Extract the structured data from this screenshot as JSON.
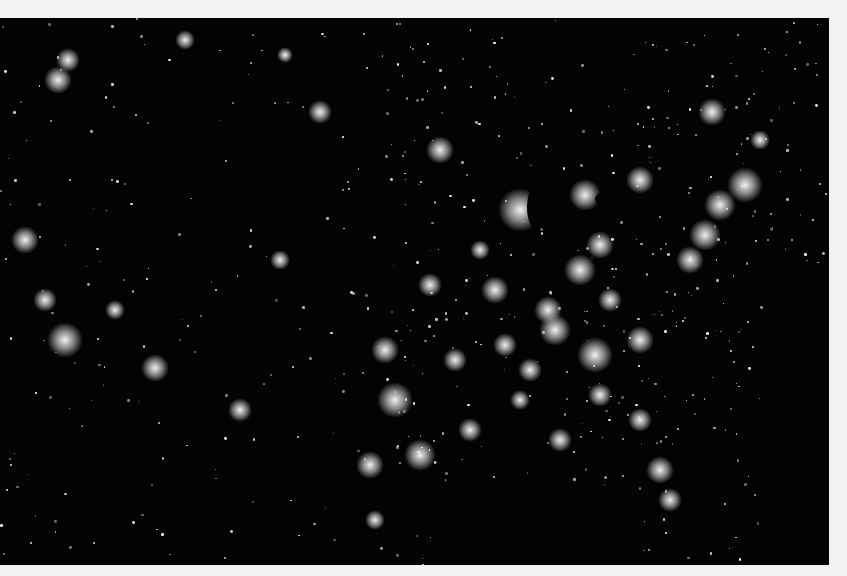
{
  "image": {
    "subject": "United States at night - city lights satellite view",
    "frame_color": "#f2f2f2",
    "background_color": "#030303",
    "light_color": "#ffffff"
  },
  "cities": [
    {
      "x": 440,
      "y": 150,
      "r": 14
    },
    {
      "x": 520,
      "y": 210,
      "r": 22
    },
    {
      "x": 585,
      "y": 195,
      "r": 16
    },
    {
      "x": 640,
      "y": 180,
      "r": 14
    },
    {
      "x": 712,
      "y": 112,
      "r": 14
    },
    {
      "x": 745,
      "y": 185,
      "r": 18
    },
    {
      "x": 720,
      "y": 205,
      "r": 16
    },
    {
      "x": 705,
      "y": 235,
      "r": 16
    },
    {
      "x": 690,
      "y": 260,
      "r": 14
    },
    {
      "x": 600,
      "y": 245,
      "r": 14
    },
    {
      "x": 580,
      "y": 270,
      "r": 16
    },
    {
      "x": 548,
      "y": 310,
      "r": 14
    },
    {
      "x": 555,
      "y": 330,
      "r": 16
    },
    {
      "x": 595,
      "y": 355,
      "r": 18
    },
    {
      "x": 640,
      "y": 340,
      "r": 14
    },
    {
      "x": 530,
      "y": 370,
      "r": 12
    },
    {
      "x": 495,
      "y": 290,
      "r": 14
    },
    {
      "x": 430,
      "y": 285,
      "r": 12
    },
    {
      "x": 385,
      "y": 350,
      "r": 14
    },
    {
      "x": 395,
      "y": 400,
      "r": 18
    },
    {
      "x": 420,
      "y": 455,
      "r": 16
    },
    {
      "x": 370,
      "y": 465,
      "r": 14
    },
    {
      "x": 455,
      "y": 360,
      "r": 12
    },
    {
      "x": 505,
      "y": 345,
      "r": 12
    },
    {
      "x": 470,
      "y": 430,
      "r": 12
    },
    {
      "x": 560,
      "y": 440,
      "r": 12
    },
    {
      "x": 640,
      "y": 420,
      "r": 12
    },
    {
      "x": 660,
      "y": 470,
      "r": 14
    },
    {
      "x": 670,
      "y": 500,
      "r": 12
    },
    {
      "x": 155,
      "y": 368,
      "r": 14
    },
    {
      "x": 115,
      "y": 310,
      "r": 10
    },
    {
      "x": 65,
      "y": 340,
      "r": 18
    },
    {
      "x": 45,
      "y": 300,
      "r": 12
    },
    {
      "x": 25,
      "y": 240,
      "r": 14
    },
    {
      "x": 58,
      "y": 80,
      "r": 14
    },
    {
      "x": 68,
      "y": 60,
      "r": 12
    },
    {
      "x": 185,
      "y": 40,
      "r": 10
    },
    {
      "x": 240,
      "y": 410,
      "r": 12
    },
    {
      "x": 280,
      "y": 260,
      "r": 10
    },
    {
      "x": 320,
      "y": 112,
      "r": 12
    },
    {
      "x": 285,
      "y": 55,
      "r": 8
    },
    {
      "x": 375,
      "y": 520,
      "r": 10
    },
    {
      "x": 760,
      "y": 140,
      "r": 10
    },
    {
      "x": 480,
      "y": 250,
      "r": 10
    },
    {
      "x": 610,
      "y": 300,
      "r": 12
    },
    {
      "x": 520,
      "y": 400,
      "r": 10
    },
    {
      "x": 600,
      "y": 395,
      "r": 12
    }
  ],
  "lakes": [
    {
      "x": 527,
      "y": 185,
      "w": 20,
      "h": 45
    },
    {
      "x": 595,
      "y": 190,
      "w": 40,
      "h": 18
    },
    {
      "x": 640,
      "y": 200,
      "w": 50,
      "h": 14
    }
  ]
}
